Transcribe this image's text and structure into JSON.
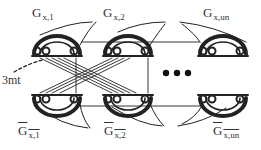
{
  "diagram": {
    "top_labels": [
      {
        "main": "G",
        "sub": "x,1",
        "x": 32,
        "y": 6
      },
      {
        "main": "G",
        "sub": "x,2",
        "x": 103,
        "y": 6
      },
      {
        "main": "G",
        "sub": "x,un",
        "x": 203,
        "y": 6
      }
    ],
    "bottom_labels": [
      {
        "main": "G",
        "sub": "x,1",
        "x": 18,
        "y": 124,
        "overline": true
      },
      {
        "main": "G",
        "sub": "x,2",
        "x": 104,
        "y": 124,
        "overline": true
      },
      {
        "main": "G",
        "sub": "x,un",
        "x": 213,
        "y": 124,
        "overline": true
      }
    ],
    "side_label": "3mt",
    "ellipsis": "• • •",
    "colors": {
      "ink": "#222222",
      "background": "#ffffff"
    }
  }
}
